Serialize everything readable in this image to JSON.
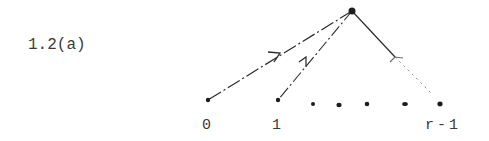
{
  "figure": {
    "label": "1.2(a)"
  },
  "diagram": {
    "type": "tree",
    "root": {
      "x": 352,
      "y": 11
    },
    "leaves": [
      {
        "id": "0",
        "label": "0",
        "x": 208,
        "y": 100,
        "edge": "dash-dot",
        "arrow": {
          "x": 278,
          "y": 54
        }
      },
      {
        "id": "1",
        "label": "1",
        "x": 278,
        "y": 100,
        "edge": "dash-dot",
        "arrow": {
          "x": 305,
          "y": 60
        }
      },
      {
        "id": "r-1",
        "label": "r-1",
        "x": 440,
        "y": 104,
        "edge": "solid-then-dotted",
        "arrow": {
          "x": 395,
          "y": 58
        }
      }
    ],
    "ellipsis_dots": [
      {
        "x": 313,
        "y": 104
      },
      {
        "x": 339,
        "y": 105
      },
      {
        "x": 367,
        "y": 104
      },
      {
        "x": 405,
        "y": 104
      }
    ],
    "ink_color": "#2b2b2b"
  }
}
